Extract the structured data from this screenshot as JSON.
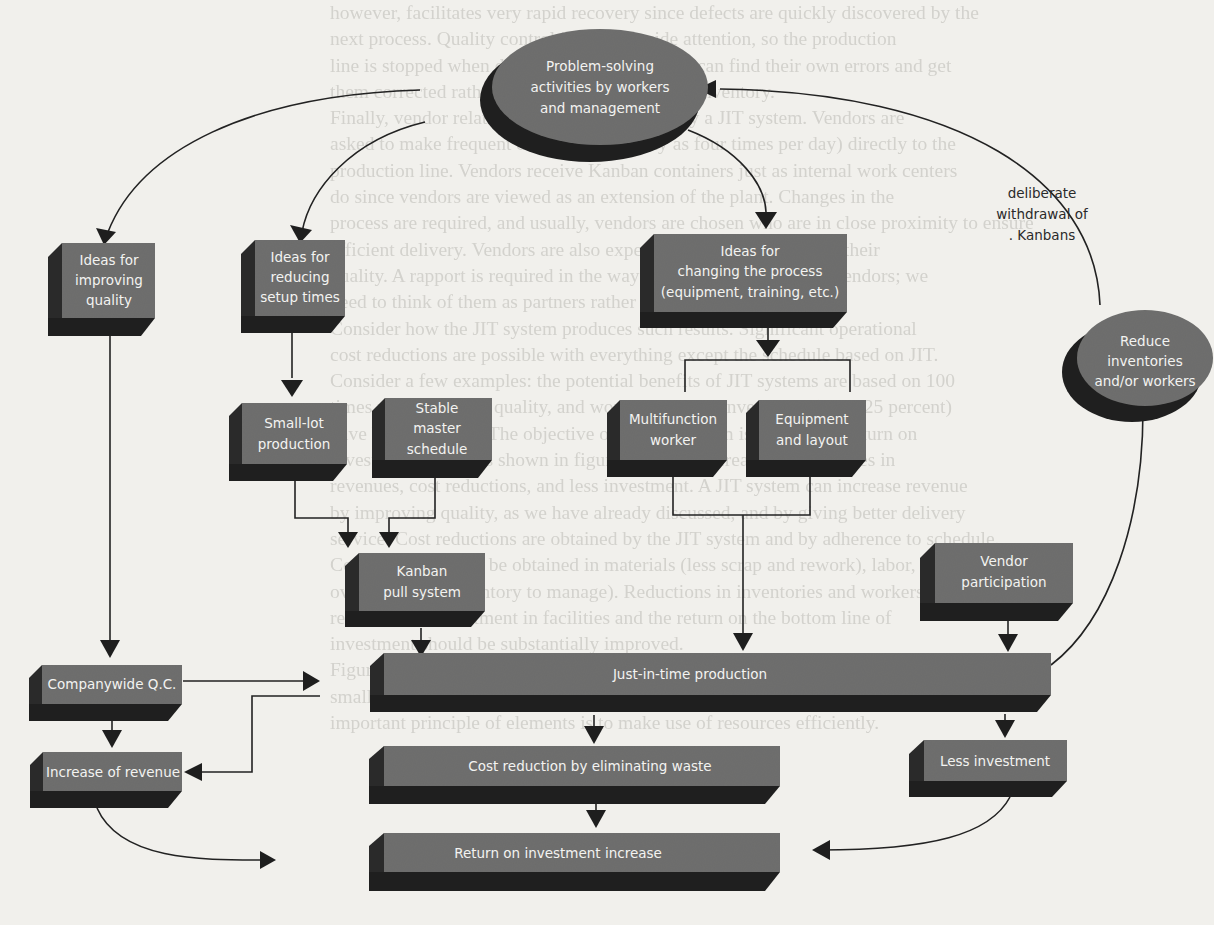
{
  "figure": {
    "background_text": [
      "however, facilitates very rapid recovery since defects are quickly discovered by the",
      "next process. Quality control is an plantwide attention, so the production",
      "line is stopped when defects occur, so workers can find their own errors and get",
      "them corrected rather than covering them with inventory.",
      "Finally, vendor relations are greatly affected by a JIT system. Vendors are",
      "asked to make frequent deliveries (as many as four times per day) directly to the",
      "production line. Vendors receive Kanban containers just as internal work centers",
      "do since vendors are viewed as an extension of the plant. Changes in the",
      "process are required, and usually, vendors are chosen who are in close proximity to ensure",
      "efficient delivery. Vendors are also expected to be responsible for their",
      "quality. A rapport is required in the way that we usually think of vendors; we",
      "need to think of them as partners rather than adversaries.",
      "Consider how the JIT system produces such results. Significant operational",
      "cost reductions are possible with everything except the schedule based on JIT.",
      "Consider a few examples: the potential benefits of JIT systems are based on 100",
      "times percent higher quality, and work-in-process inventories (15 to 25 percent)",
      "have been reported. The objective of the JIT system is to improve return on",
      "investment (ROI), as shown in figure, it can be increased by increases in",
      "revenues, cost reductions, and less investment. A JIT system can increase revenue",
      "by improving quality, as we have already discussed, and by giving better delivery",
      "service. Cost reductions are obtained by the JIT system and by adherence to schedule.",
      "Cost reductions can be obtained in materials (less scrap and rework), labor, and",
      "overhead (less inventory to manage). Reductions in inventories and workers",
      "result in less investment in facilities and the return on the bottom line of",
      "investment should be substantially improved.",
      "Figure summarizes the JIT system as it has been described thus far, including",
      "small lots, and all other elements of just-in-time production. The most",
      "important principle of elements is to make use of resources efficiently."
    ],
    "nodes": {
      "problem_solving": {
        "label": [
          "Problem-solving",
          "activities by workers",
          "and management"
        ],
        "shape": "ellipse"
      },
      "improving_quality": {
        "label": [
          "Ideas for",
          "improving",
          "quality"
        ]
      },
      "reducing_setup": {
        "label": [
          "Ideas for",
          "reducing",
          "setup times"
        ]
      },
      "changing_process": {
        "label": [
          "Ideas for",
          "changing the process",
          "(equipment, training, etc.)"
        ]
      },
      "reduce_inventories": {
        "label": [
          "Reduce",
          "inventories",
          "and/or workers"
        ],
        "shape": "ellipse"
      },
      "small_lot": {
        "label": [
          "Small-lot",
          "production"
        ]
      },
      "stable_schedule": {
        "label": [
          "Stable",
          "master",
          "schedule"
        ]
      },
      "multifunction": {
        "label": [
          "Multifunction",
          "worker"
        ]
      },
      "equipment_layout": {
        "label": [
          "Equipment",
          "and layout"
        ]
      },
      "kanban": {
        "label": [
          "Kanban",
          "pull system"
        ]
      },
      "vendor": {
        "label": [
          "Vendor",
          "participation"
        ]
      },
      "jit": {
        "label": [
          "Just-in-time production"
        ]
      },
      "companywide_qc": {
        "label": [
          "Companywide Q.C."
        ]
      },
      "increase_revenue": {
        "label": [
          "Increase of revenue"
        ]
      },
      "cost_reduction": {
        "label": [
          "Cost reduction by eliminating waste"
        ]
      },
      "less_investment": {
        "label": [
          "Less investment"
        ]
      },
      "roi": {
        "label": [
          "Return on investment increase"
        ]
      }
    },
    "annotation": [
      "deliberate",
      "withdrawal of",
      ". Kanbans"
    ],
    "colors": {
      "page": "#f1f0ec",
      "box_face": "#6f6f6e",
      "box_shadow": "#242424",
      "label_text": "#f3f3f1",
      "line": "#222222"
    }
  }
}
